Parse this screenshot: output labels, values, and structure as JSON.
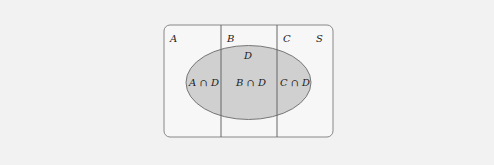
{
  "diagram": {
    "universe_label": "S",
    "sets": [
      {
        "id": "A",
        "label": "A"
      },
      {
        "id": "B",
        "label": "B"
      },
      {
        "id": "C",
        "label": "C"
      }
    ],
    "event_label": "D",
    "intersections": [
      {
        "label": "A ∩ D"
      },
      {
        "label": "B ∩ D"
      },
      {
        "label": "C ∩ D"
      }
    ],
    "colors": {
      "background": "#f2f2f2",
      "universe_fill": "#f7f7f7",
      "event_fill": "#d0d0d0",
      "stroke": "#666666"
    }
  }
}
